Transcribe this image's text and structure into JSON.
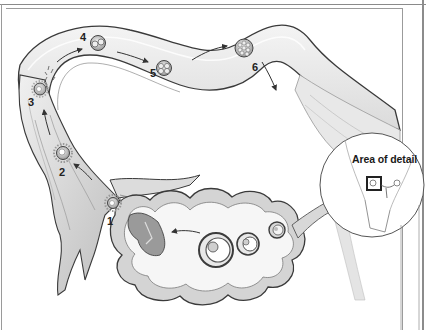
{
  "diagram": {
    "stages": [
      {
        "id": 1,
        "label": "1"
      },
      {
        "id": 2,
        "label": "2"
      },
      {
        "id": 3,
        "label": "3"
      },
      {
        "id": 4,
        "label": "4"
      },
      {
        "id": 5,
        "label": "5"
      },
      {
        "id": 6,
        "label": "6"
      }
    ],
    "inset": {
      "label": "Area of detail"
    },
    "colors": {
      "background": "#ffffff",
      "line": "#3a3a3a",
      "tube_fill": "#e6e6e6",
      "ovary_fill": "#d2d2d2",
      "text": "#222222"
    }
  }
}
